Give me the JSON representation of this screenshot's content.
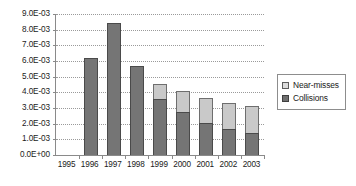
{
  "chart_data": {
    "type": "bar",
    "subtype": "stacked-column",
    "title": "",
    "xlabel": "",
    "ylabel": "",
    "categories": [
      "1995",
      "1996",
      "1997",
      "1998",
      "1999",
      "2000",
      "2001",
      "2002",
      "2003"
    ],
    "series": [
      {
        "name": "Collisions",
        "color": "#757575",
        "values": [
          0,
          0.0062,
          0.0084,
          0.00565,
          0.0036,
          0.00275,
          0.00205,
          0.00165,
          0.0014
        ]
      },
      {
        "name": "Near-misses",
        "color": "#c9c9c9",
        "values": [
          0,
          0,
          0,
          0,
          0.00095,
          0.00135,
          0.0016,
          0.0017,
          0.0017
        ]
      }
    ],
    "stack_order": [
      "Collisions",
      "Near-misses"
    ],
    "totals": [
      0,
      0.0062,
      0.0084,
      0.00565,
      0.00455,
      0.0041,
      0.00365,
      0.00335,
      0.0031
    ],
    "ylim": [
      0,
      0.009
    ],
    "ytick_step": 0.001,
    "ytick_labels": [
      "0.0E+00",
      "1.0E-03",
      "2.0E-03",
      "3.0E-03",
      "4.0E-03",
      "5.0E-03",
      "6.0E-03",
      "7.0E-03",
      "8.0E-03",
      "9.0E-03"
    ],
    "ytick_values": [
      0,
      0.001,
      0.002,
      0.003,
      0.004,
      0.005,
      0.006,
      0.007,
      0.008,
      0.009
    ],
    "grid": true,
    "grid_style": "dotted",
    "legend_position": "right",
    "legend_entries": [
      "Near-misses",
      "Collisions"
    ]
  },
  "legend": {
    "items": [
      {
        "label": "Near-misses",
        "swatch": "near-misses-swatch"
      },
      {
        "label": "Collisions",
        "swatch": "collisions-swatch"
      }
    ]
  },
  "colors": {
    "collisions": "#757575",
    "near_misses": "#c9c9c9",
    "axis": "#8a8a8a",
    "grid": "#9a9a9a",
    "background": "#ffffff",
    "text": "#1a1a1a"
  }
}
